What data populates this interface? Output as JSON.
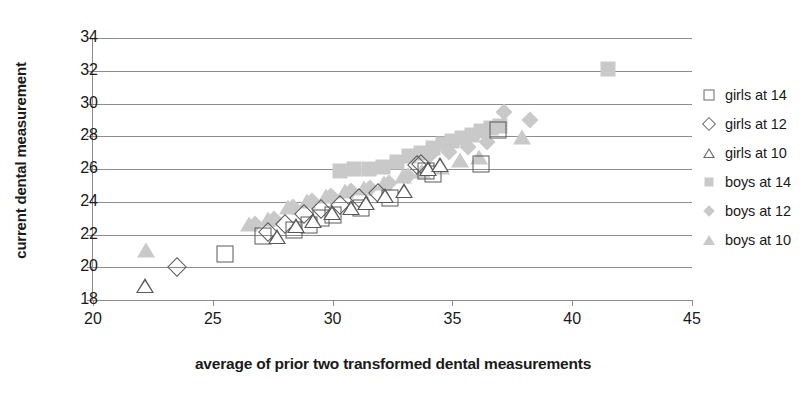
{
  "chart_data": {
    "type": "scatter",
    "title": "",
    "xlabel": "average of prior two transformed dental measurements",
    "ylabel": "current dental measurement",
    "xlim": [
      20,
      45
    ],
    "ylim": [
      18,
      34
    ],
    "xticks": [
      20,
      25,
      30,
      35,
      40,
      45
    ],
    "yticks": [
      18,
      20,
      22,
      24,
      26,
      28,
      30,
      32,
      34
    ],
    "grid": "horizontal",
    "legend_position": "right",
    "colors": {
      "girls_marker_outline": "#595959",
      "boys_marker_fill": "#c9c9c9",
      "gridline": "#8c8c8c",
      "background": "#ffffff",
      "text": "#1a1a1a"
    },
    "series": [
      {
        "name": "girls at 14",
        "marker": "square-open",
        "points": [
          [
            25.5,
            20.8
          ],
          [
            27.1,
            21.9
          ],
          [
            28.4,
            22.3
          ],
          [
            29.0,
            22.6
          ],
          [
            29.5,
            23.0
          ],
          [
            30.0,
            23.2
          ],
          [
            31.2,
            23.6
          ],
          [
            32.4,
            24.2
          ],
          [
            33.9,
            25.9
          ],
          [
            34.2,
            25.7
          ],
          [
            36.2,
            26.3
          ],
          [
            36.9,
            28.4
          ]
        ]
      },
      {
        "name": "girls at 12",
        "marker": "diamond-open",
        "points": [
          [
            23.8,
            19.6
          ],
          [
            27.6,
            21.7
          ],
          [
            28.3,
            22.2
          ],
          [
            29.1,
            22.8
          ],
          [
            29.8,
            23.1
          ],
          [
            30.6,
            23.4
          ],
          [
            31.4,
            23.8
          ],
          [
            32.2,
            24.1
          ],
          [
            33.8,
            25.8
          ],
          [
            34.0,
            25.9
          ]
        ]
      },
      {
        "name": "girls at 10",
        "marker": "triangle-open",
        "points": [
          [
            21.8,
            18.4
          ],
          [
            27.3,
            21.4
          ],
          [
            28.1,
            22.1
          ],
          [
            28.8,
            22.4
          ],
          [
            29.6,
            22.9
          ],
          [
            30.4,
            23.2
          ],
          [
            31.0,
            23.5
          ],
          [
            31.8,
            23.9
          ],
          [
            32.6,
            24.2
          ],
          [
            33.6,
            25.6
          ],
          [
            34.1,
            25.8
          ]
        ]
      },
      {
        "name": "boys at 14",
        "marker": "square-filled",
        "points": [
          [
            30.3,
            25.9
          ],
          [
            30.9,
            26.0
          ],
          [
            31.5,
            26.0
          ],
          [
            32.1,
            26.1
          ],
          [
            32.7,
            26.4
          ],
          [
            33.2,
            26.8
          ],
          [
            33.7,
            27.0
          ],
          [
            34.2,
            27.3
          ],
          [
            34.6,
            27.5
          ],
          [
            35.0,
            27.7
          ],
          [
            35.4,
            27.9
          ],
          [
            35.8,
            28.1
          ],
          [
            36.2,
            28.3
          ],
          [
            36.6,
            28.5
          ],
          [
            37.0,
            28.6
          ],
          [
            41.5,
            32.1
          ]
        ]
      },
      {
        "name": "boys at 12",
        "marker": "diamond-filled",
        "points": [
          [
            27.0,
            22.3
          ],
          [
            27.8,
            22.6
          ],
          [
            28.6,
            23.3
          ],
          [
            29.4,
            23.7
          ],
          [
            30.2,
            24.0
          ],
          [
            31.0,
            24.3
          ],
          [
            31.8,
            24.5
          ],
          [
            32.6,
            24.8
          ],
          [
            33.4,
            25.2
          ],
          [
            34.3,
            26.5
          ],
          [
            35.1,
            26.7
          ],
          [
            35.9,
            27.0
          ],
          [
            36.7,
            27.3
          ],
          [
            37.4,
            29.1
          ],
          [
            38.5,
            28.6
          ]
        ]
      },
      {
        "name": "boys at 10",
        "marker": "triangle-filled",
        "points": [
          [
            22.6,
            20.5
          ],
          [
            26.9,
            22.1
          ],
          [
            27.7,
            22.4
          ],
          [
            28.5,
            23.1
          ],
          [
            29.3,
            23.5
          ],
          [
            30.1,
            23.8
          ],
          [
            30.9,
            24.1
          ],
          [
            31.7,
            24.3
          ],
          [
            32.5,
            24.6
          ],
          [
            33.3,
            25.0
          ],
          [
            34.1,
            25.3
          ],
          [
            34.9,
            25.6
          ],
          [
            35.7,
            26.0
          ],
          [
            36.5,
            26.2
          ],
          [
            38.3,
            27.4
          ]
        ]
      }
    ]
  }
}
